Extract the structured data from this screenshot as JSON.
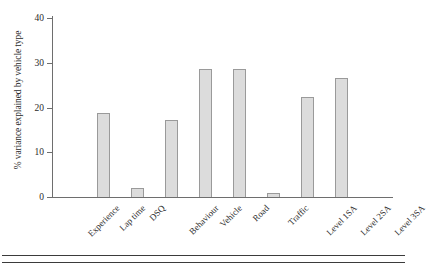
{
  "chart_data": {
    "type": "bar",
    "title": "",
    "xlabel": "",
    "ylabel": "% variance explained by vehicle type",
    "ylim": [
      0,
      40
    ],
    "yticks": [
      0,
      10,
      20,
      30,
      40
    ],
    "ytick_labels": [
      "0",
      "10",
      "20",
      "30",
      "40"
    ],
    "grid": false,
    "legend": "none",
    "categories": [
      "Experience",
      "Lap time",
      "DSQ",
      "Behaviour",
      "Vehicle",
      "Road",
      "Traffic",
      "Level 1SA",
      "Level 2SA",
      "Level 3SA"
    ],
    "values": [
      0,
      18.8,
      2.1,
      17.2,
      28.6,
      28.6,
      0.9,
      22.3,
      26.5,
      0
    ],
    "bar_fill_color": "#dcdcdc",
    "bar_border_color": "#9a9a9a",
    "axis_color": "#6e6e6e"
  }
}
